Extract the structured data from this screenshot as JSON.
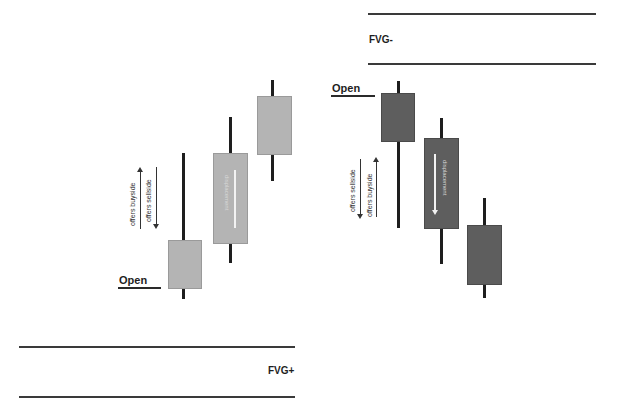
{
  "zones": {
    "fvg_minus": {
      "label": "FVG-"
    },
    "fvg_plus": {
      "label": "FVG+"
    }
  },
  "bullish": {
    "open_label": "Open",
    "annotation_up": "offers buyside",
    "annotation_down": "offers sellside",
    "inner_text": "displacement"
  },
  "bearish": {
    "open_label": "Open",
    "annotation_down": "offers sellside",
    "annotation_up": "offers buyside",
    "inner_text": "displacement"
  },
  "colors": {
    "bullish_body": "#b4b4b4",
    "bearish_body": "#5e5e5e",
    "wick": "#1e1e1e",
    "line": "#3a3a3a"
  }
}
